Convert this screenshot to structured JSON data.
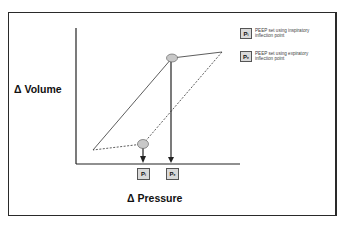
{
  "diagram": {
    "y_axis_label": "Δ Volume",
    "x_axis_label": "Δ Pressure",
    "markers": [
      {
        "id": "pi",
        "symbol": "P",
        "subscript": "i"
      },
      {
        "id": "pe",
        "symbol": "P",
        "subscript": "e"
      }
    ],
    "legend": [
      {
        "symbol": "P",
        "subscript": "i",
        "text": "PEEP set using inspiratory inflection point"
      },
      {
        "symbol": "P",
        "subscript": "e",
        "text": "PEEP set using expiratory inflection point"
      }
    ],
    "colors": {
      "line": "#333333",
      "ellipse_fill": "#c8c8c8",
      "marker_box": "#d9d9d9"
    }
  }
}
